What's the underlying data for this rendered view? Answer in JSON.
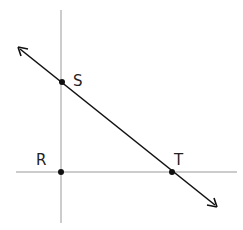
{
  "diagram": {
    "points": [
      {
        "label": "S",
        "x": 62,
        "y": 82
      },
      {
        "label": "R",
        "x": 61,
        "y": 172
      },
      {
        "label": "T",
        "x": 172,
        "y": 172
      }
    ],
    "labels": {
      "S": "S",
      "R": "R",
      "T": "T"
    },
    "lines": [
      {
        "name": "vertical-axis",
        "from": [
          61,
          10
        ],
        "to": [
          61,
          223
        ]
      },
      {
        "name": "horizontal-axis",
        "from": [
          16,
          172
        ],
        "to": [
          237,
          172
        ]
      },
      {
        "name": "line-ST",
        "from": [
          18,
          47
        ],
        "to": [
          217,
          207
        ],
        "arrows": "both"
      }
    ],
    "colors": {
      "line": "#111111",
      "axis": "#999999"
    }
  }
}
